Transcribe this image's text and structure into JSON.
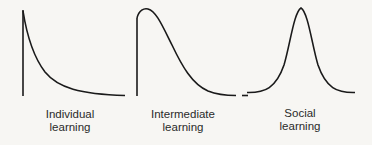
{
  "figure": {
    "panels": [
      {
        "id": "individual",
        "label_line1": "Individual",
        "label_line2": "learning",
        "shape": "exponential-decay"
      },
      {
        "id": "intermediate",
        "label_line1": "Intermediate",
        "label_line2": "learning",
        "shape": "right-skewed-hump"
      },
      {
        "id": "social",
        "label_line1": "Social",
        "label_line2": "learning",
        "shape": "bell"
      }
    ],
    "colors": {
      "stroke": "#1a1a1a",
      "background": "#f7f6f3",
      "text": "#2a2a2a"
    }
  }
}
